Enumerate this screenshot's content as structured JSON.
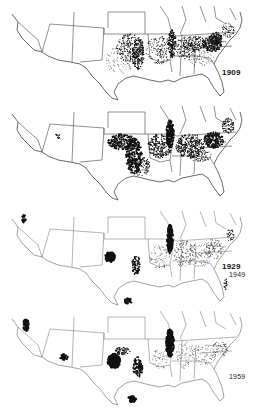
{
  "figure": {
    "panels": [
      {
        "year": "1909",
        "density": "high-east"
      },
      {
        "year": "1929",
        "density": "high-west"
      },
      {
        "year": "1949",
        "density": "shifting-west"
      },
      {
        "year": "1959",
        "density": "concentrated"
      }
    ]
  },
  "colors": {
    "outline": "#444444",
    "dots": "#111111",
    "background": "#ffffff"
  }
}
